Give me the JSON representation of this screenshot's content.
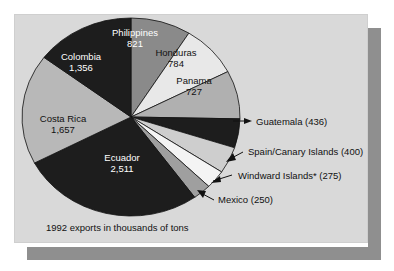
{
  "figure": {
    "caption": "1992 exports in thousands of tons",
    "panel_color": "#d9d9d9",
    "shadow_color": "#8f8f8f"
  },
  "chart_data": {
    "type": "pie",
    "title": "",
    "subtitle": "",
    "unit": "thousands of tons",
    "year": "1992",
    "total": 9217,
    "legend_position": "none",
    "grid": false,
    "categories": [
      "Philippines",
      "Honduras",
      "Panama",
      "Guatemala",
      "Spain/Canary Islands",
      "Windward Islands*",
      "Mexico",
      "Ecuador",
      "Costa Rica",
      "Colombia"
    ],
    "values": [
      821,
      784,
      727,
      436,
      400,
      275,
      250,
      2511,
      1657,
      1356
    ],
    "slices": [
      {
        "name": "Philippines",
        "value": 821,
        "value_text": "821",
        "color": "#8a8a8a",
        "label_style": "inside",
        "text_color": "#ffffff"
      },
      {
        "name": "Honduras",
        "value": 784,
        "value_text": "784",
        "color": "#e8e8e8",
        "label_style": "inside",
        "text_color": "#111111"
      },
      {
        "name": "Panama",
        "value": 727,
        "value_text": "727",
        "color": "#b0b0b0",
        "label_style": "inside",
        "text_color": "#111111"
      },
      {
        "name": "Guatemala",
        "value": 436,
        "value_text": "(436)",
        "color": "#1d1d1d",
        "label_style": "callout",
        "text_color": "#111111"
      },
      {
        "name": "Spain/Canary Islands",
        "value": 400,
        "value_text": "(400)",
        "color": "#cecece",
        "label_style": "callout",
        "text_color": "#111111"
      },
      {
        "name": "Windward Islands*",
        "value": 275,
        "value_text": "(275)",
        "color": "#f4f4f4",
        "label_style": "callout",
        "text_color": "#111111"
      },
      {
        "name": "Mexico",
        "value": 250,
        "value_text": "(250)",
        "color": "#9f9f9f",
        "label_style": "callout",
        "text_color": "#111111"
      },
      {
        "name": "Ecuador",
        "value": 2511,
        "value_text": "2,511",
        "color": "#1d1d1d",
        "label_style": "inside",
        "text_color": "#ffffff"
      },
      {
        "name": "Costa Rica",
        "value": 1657,
        "value_text": "1,657",
        "color": "#b8b8b8",
        "label_style": "inside",
        "text_color": "#111111"
      },
      {
        "name": "Colombia",
        "value": 1356,
        "value_text": "1,356",
        "color": "#1d1d1d",
        "label_style": "inside",
        "text_color": "#ffffff"
      }
    ],
    "inside_labels": [
      {
        "name": "Philippines",
        "value_text": "821"
      },
      {
        "name": "Honduras",
        "value_text": "784"
      },
      {
        "name": "Panama",
        "value_text": "727"
      },
      {
        "name": "Ecuador",
        "value_text": "2,511"
      },
      {
        "name": "Costa Rica",
        "value_text": "1,657"
      },
      {
        "name": "Colombia",
        "value_text": "1,356"
      }
    ],
    "callouts": [
      {
        "text": "Guatemala (436)"
      },
      {
        "text": "Spain/Canary Islands (400)"
      },
      {
        "text": "Windward Islands* (275)"
      },
      {
        "text": "Mexico (250)"
      }
    ]
  }
}
